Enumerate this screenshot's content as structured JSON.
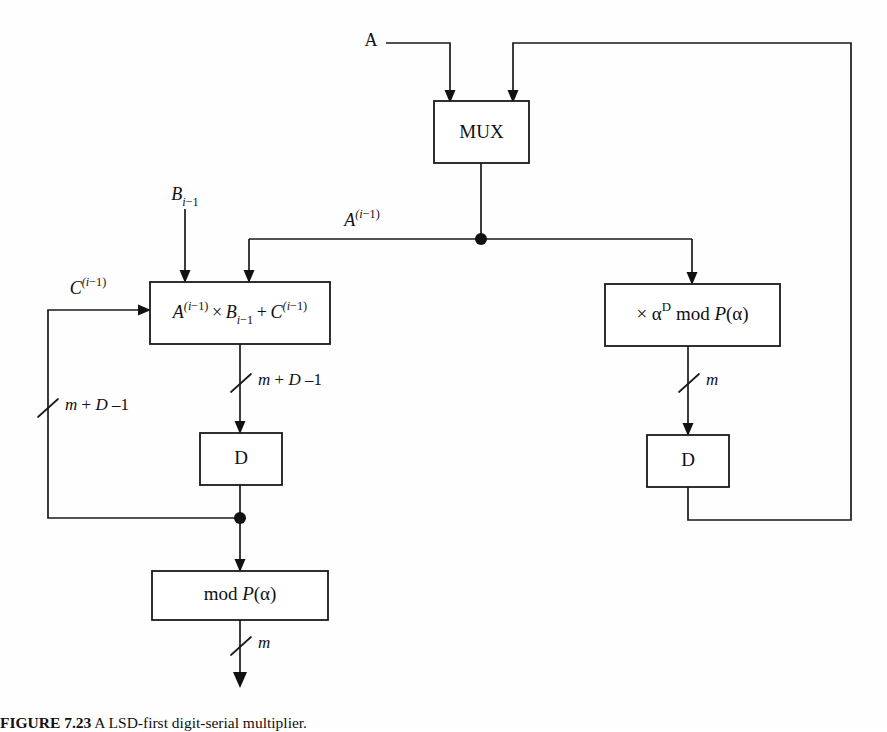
{
  "figure": {
    "caption_number": "FIGURE 7.23",
    "caption_text": "A LSD-first digit-serial multiplier."
  },
  "blocks": {
    "mux": {
      "label": "MUX",
      "x": 434,
      "y": 101,
      "w": 95,
      "h": 62
    },
    "multiplier": {
      "label_parts": [
        "A",
        "(i−1)",
        " × ",
        "B",
        "i−1",
        " + ",
        "C",
        "(i−1)"
      ],
      "label_plain": "A(i−1) × Bi−1 + C(i−1)",
      "x": 150,
      "y": 282,
      "w": 180,
      "h": 62
    },
    "alpha_mod": {
      "label_plain": "× αD mod P(α)",
      "x": 605,
      "y": 284,
      "w": 175,
      "h": 62
    },
    "delay_left": {
      "label": "D",
      "x": 200,
      "y": 433,
      "w": 82,
      "h": 52
    },
    "delay_right": {
      "label": "D",
      "x": 647,
      "y": 435,
      "w": 82,
      "h": 52
    },
    "mod_p": {
      "label_plain": "mod P(α)",
      "x": 152,
      "y": 571,
      "w": 176,
      "h": 49
    }
  },
  "signals": {
    "input_a": "A",
    "input_b_plain": "Bi−1",
    "feedback_a_plain": "A(i−1)",
    "feedback_c_plain": "C(i−1)"
  },
  "bus_widths": {
    "mult_out": "m + D –1",
    "feedback_c": "m + D –1",
    "alpha_out": "m",
    "mod_out": "m"
  },
  "colors": {
    "line": "#1a1a1a",
    "background": "#ffffff",
    "text": "#111111"
  }
}
